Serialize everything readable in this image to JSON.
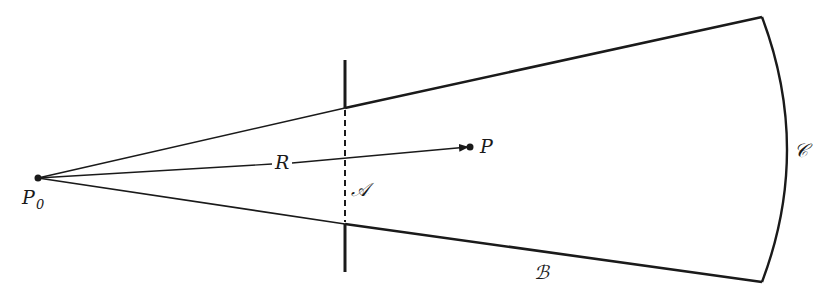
{
  "diagram": {
    "type": "diffraction-geometry",
    "colors": {
      "ink": "#1a1a1a",
      "background": "#ffffff"
    },
    "points": {
      "source": {
        "label": "P",
        "subscript": "0"
      },
      "observation": {
        "label": "P"
      }
    },
    "vector": {
      "label": "R"
    },
    "surfaces": {
      "aperture": {
        "label": "𝒜"
      },
      "screen_side": {
        "label": "ℬ"
      },
      "spherical_cap": {
        "label": "𝒞"
      }
    }
  }
}
